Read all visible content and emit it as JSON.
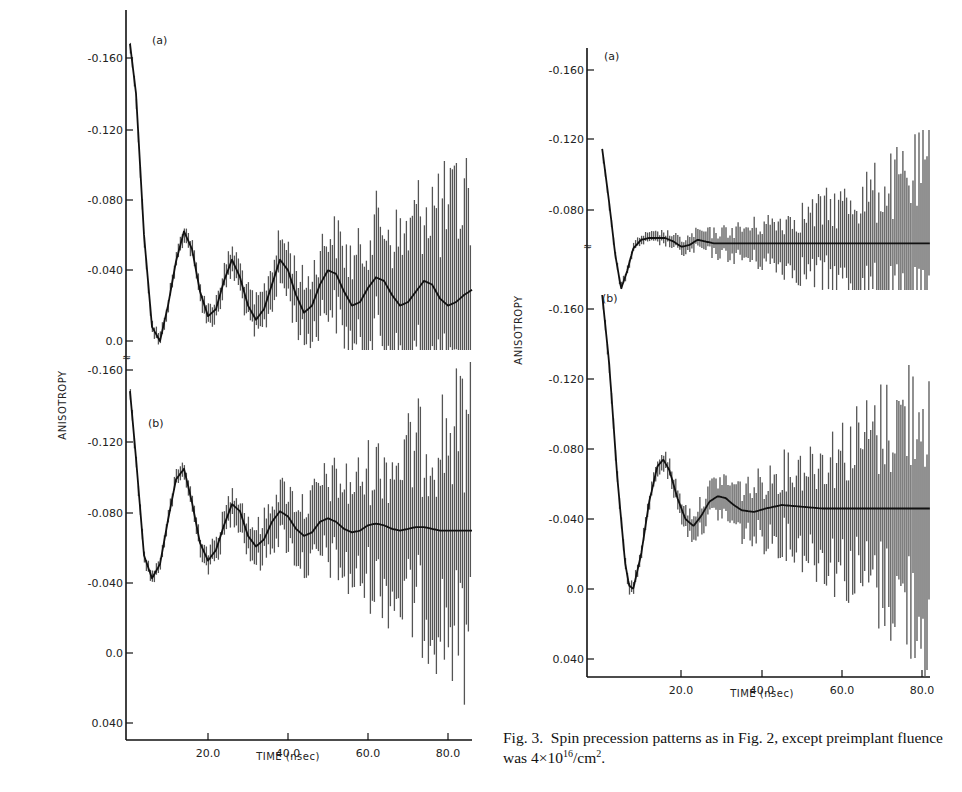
{
  "figure": {
    "caption": {
      "prefix": "Fig. 3.",
      "text": "Spin precession patterns as in Fig. 2, except preimplant fluence was 4×10",
      "exp": "16",
      "unit": "/cm",
      "unit_exp": "2",
      "end": "."
    }
  },
  "chart_data": [
    {
      "type": "line",
      "title": "Left figure (Fig. 2 style) — spin precession, two panels",
      "xlabel": "TIME (nsec)",
      "ylabel": "ANISOTROPY",
      "x_ticks": [
        "20.0",
        "40.0",
        "60.0",
        "80.0"
      ],
      "xlim": [
        0,
        87
      ],
      "panels": [
        {
          "label": "(a)",
          "y_ticks": [
            "-0.160",
            "-0.120",
            "-0.080",
            "-0.040",
            "0.0"
          ],
          "ylim_inverted": [
            -0.17,
            0.0
          ],
          "series": [
            {
              "name": "fit",
              "x": [
                0.5,
                2,
                4,
                6,
                8,
                10,
                12,
                14,
                16,
                18,
                20,
                22,
                24,
                26,
                28,
                30,
                32,
                34,
                36,
                38,
                40,
                42,
                44,
                46,
                48,
                50,
                52,
                54,
                56,
                58,
                60,
                62,
                64,
                66,
                68,
                70,
                72,
                74,
                76,
                78,
                80,
                82,
                84,
                86
              ],
              "y": [
                -0.168,
                -0.14,
                -0.06,
                -0.008,
                0.0,
                -0.02,
                -0.045,
                -0.062,
                -0.052,
                -0.028,
                -0.014,
                -0.018,
                -0.034,
                -0.046,
                -0.036,
                -0.02,
                -0.012,
                -0.018,
                -0.032,
                -0.046,
                -0.04,
                -0.026,
                -0.016,
                -0.02,
                -0.032,
                -0.04,
                -0.038,
                -0.028,
                -0.02,
                -0.022,
                -0.03,
                -0.036,
                -0.034,
                -0.026,
                -0.02,
                -0.022,
                -0.028,
                -0.034,
                -0.032,
                -0.024,
                -0.02,
                -0.022,
                -0.026,
                -0.029
              ]
            }
          ],
          "note": "data points with error bars growing with time, up to ±0.07 at 80 ns"
        },
        {
          "label": "(b)",
          "y_ticks": [
            "-0.160",
            "-0.120",
            "-0.080",
            "-0.040",
            "0.0",
            "0.040"
          ],
          "ylim_inverted": [
            -0.165,
            0.048
          ],
          "series": [
            {
              "name": "fit",
              "x": [
                0.5,
                2,
                4,
                6,
                8,
                10,
                12,
                14,
                16,
                18,
                20,
                22,
                24,
                26,
                28,
                30,
                32,
                34,
                36,
                38,
                40,
                42,
                44,
                46,
                48,
                50,
                52,
                54,
                56,
                58,
                60,
                62,
                64,
                66,
                68,
                70,
                72,
                74,
                76,
                78,
                80,
                82,
                84,
                86
              ],
              "y": [
                -0.148,
                -0.11,
                -0.055,
                -0.042,
                -0.05,
                -0.075,
                -0.098,
                -0.104,
                -0.085,
                -0.062,
                -0.052,
                -0.058,
                -0.072,
                -0.084,
                -0.08,
                -0.066,
                -0.06,
                -0.064,
                -0.074,
                -0.08,
                -0.077,
                -0.07,
                -0.066,
                -0.068,
                -0.074,
                -0.076,
                -0.074,
                -0.07,
                -0.068,
                -0.069,
                -0.072,
                -0.073,
                -0.072,
                -0.07,
                -0.069,
                -0.07,
                -0.071,
                -0.071,
                -0.07,
                -0.069,
                -0.069,
                -0.069,
                -0.069,
                -0.069
              ]
            }
          ],
          "note": "data points with error bars, large scatter beyond 60 ns"
        }
      ]
    },
    {
      "type": "line",
      "title": "Fig. 3 — spin precession, preimplant fluence 4×10^16/cm^2",
      "xlabel": "TIME (nsec)",
      "ylabel": "ANISOTROPY",
      "x_ticks": [
        "20.0",
        "40.0",
        "60.0",
        "80.0"
      ],
      "xlim": [
        0,
        82
      ],
      "panels": [
        {
          "label": "(a)",
          "y_ticks": [
            "-0.160",
            "-0.120",
            "-0.080"
          ],
          "ylim_inverted": [
            -0.172,
            -0.05
          ],
          "series": [
            {
              "name": "fit",
              "x": [
                0.3,
                2,
                3.5,
                5,
                6.5,
                8,
                10,
                12,
                14,
                16,
                18,
                20,
                22,
                24,
                26,
                28,
                30,
                35,
                40,
                50,
                60,
                70,
                82
              ],
              "y": [
                -0.115,
                -0.085,
                -0.055,
                -0.035,
                -0.045,
                -0.058,
                -0.063,
                -0.064,
                -0.064,
                -0.064,
                -0.062,
                -0.059,
                -0.06,
                -0.063,
                -0.062,
                -0.061,
                -0.061,
                -0.061,
                -0.061,
                -0.061,
                -0.061,
                -0.061,
                -0.061
              ]
            }
          ],
          "note": "y-axis break (≈) below -0.080; error bars grow to ~±0.05 at 80 ns"
        },
        {
          "label": "(b)",
          "y_ticks": [
            "-0.160",
            "-0.120",
            "-0.080",
            "-0.040",
            "0.0",
            "0.040"
          ],
          "ylim_inverted": [
            -0.172,
            0.05
          ],
          "series": [
            {
              "name": "fit",
              "x": [
                0.3,
                2,
                4,
                6,
                7,
                8,
                10,
                12,
                14,
                15.5,
                17,
                19,
                21,
                23,
                25,
                27,
                29,
                31,
                33,
                35,
                38,
                41,
                45,
                50,
                55,
                60,
                70,
                82
              ],
              "y": [
                -0.168,
                -0.13,
                -0.065,
                -0.015,
                -0.002,
                0.0,
                -0.02,
                -0.05,
                -0.07,
                -0.074,
                -0.068,
                -0.052,
                -0.04,
                -0.036,
                -0.042,
                -0.05,
                -0.053,
                -0.052,
                -0.048,
                -0.045,
                -0.044,
                -0.046,
                -0.048,
                -0.047,
                -0.046,
                -0.046,
                -0.046,
                -0.046
              ]
            }
          ],
          "note": "data points with error bars, strongly increasing beyond 60 ns"
        }
      ]
    }
  ]
}
